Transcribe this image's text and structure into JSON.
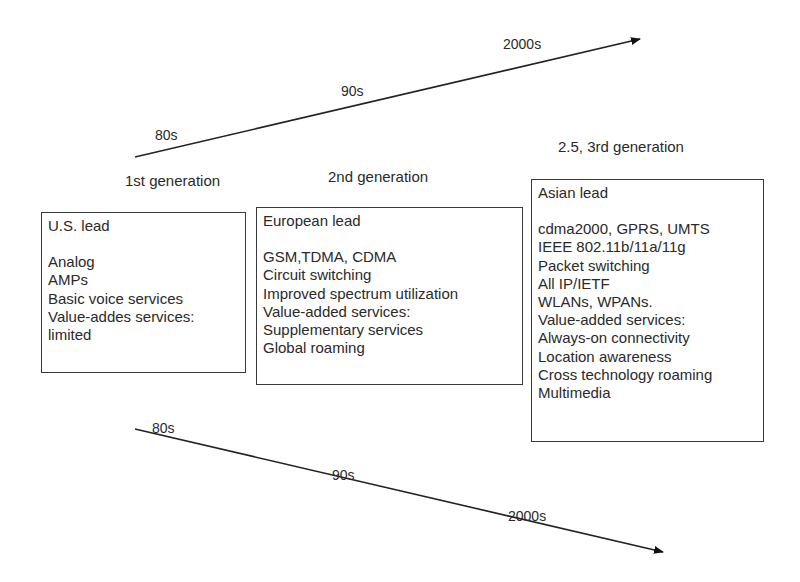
{
  "top_timeline": {
    "labels": [
      "80s",
      "90s",
      "2000s"
    ]
  },
  "bottom_timeline": {
    "labels": [
      "80s",
      "90s",
      "2000s"
    ]
  },
  "generations": [
    {
      "title": "1st generation",
      "lead": "U.S. lead",
      "items": [
        "Analog",
        "AMPs",
        "Basic voice services",
        "Value-addes services:",
        "limited"
      ]
    },
    {
      "title": "2nd generation",
      "lead": "European lead",
      "items": [
        "GSM,TDMA, CDMA",
        "Circuit switching",
        "Improved spectrum utilization",
        "Value-added services:",
        "Supplementary services",
        "Global roaming"
      ]
    },
    {
      "title": "2.5, 3rd generation",
      "lead": "Asian lead",
      "items": [
        "cdma2000, GPRS, UMTS",
        "IEEE 802.11b/11a/11g",
        "Packet switching",
        "All IP/IETF",
        "WLANs, WPANs.",
        "Value-added services:",
        "Always-on connectivity",
        "Location awareness",
        "Cross technology roaming",
        "Multimedia"
      ]
    }
  ]
}
